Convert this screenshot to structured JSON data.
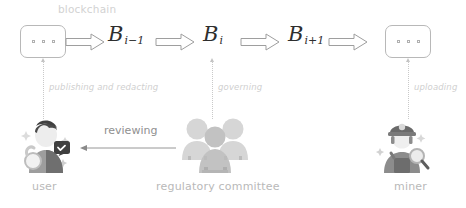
{
  "diagram": {
    "title_label": "blockchain",
    "blocks": [
      {
        "name": "prev-ellipsis",
        "label": "· · ·",
        "type": "ellipsis"
      },
      {
        "name": "block-i-minus-1",
        "base": "B",
        "subscript": "i−1",
        "type": "block"
      },
      {
        "name": "block-i",
        "base": "B",
        "subscript": "i",
        "type": "block"
      },
      {
        "name": "block-i-plus-1",
        "base": "B",
        "subscript": "i+1",
        "type": "block"
      },
      {
        "name": "next-ellipsis",
        "label": "· · ·",
        "type": "ellipsis"
      }
    ],
    "vertical_links": [
      {
        "label": "publishing and redacting",
        "from": "user",
        "to": "prev-ellipsis"
      },
      {
        "label": "governing",
        "from": "regulatory-committee",
        "to": "block-i"
      },
      {
        "label": "uploading",
        "from": "miner",
        "to": "next-ellipsis"
      }
    ],
    "actors": [
      {
        "id": "user",
        "caption": "user",
        "icon": "user-with-unlock-icon"
      },
      {
        "id": "regulatory-committee",
        "caption": "regulatory committee",
        "icon": "people-group-icon"
      },
      {
        "id": "miner",
        "caption": "miner",
        "icon": "miner-with-helmet-icon"
      }
    ],
    "horizontal_link": {
      "label": "reviewing",
      "from": "regulatory-committee",
      "to": "user",
      "direction": "left"
    },
    "colors": {
      "block_outline": "#b8b8b8",
      "block_text": "#2e2e2e",
      "faint_label": "#cfcfcf",
      "caption": "#b9b9b9",
      "arrow_outline": "#9e9e9e",
      "review_text": "#8f8f8f",
      "background": "#ffffff"
    }
  }
}
